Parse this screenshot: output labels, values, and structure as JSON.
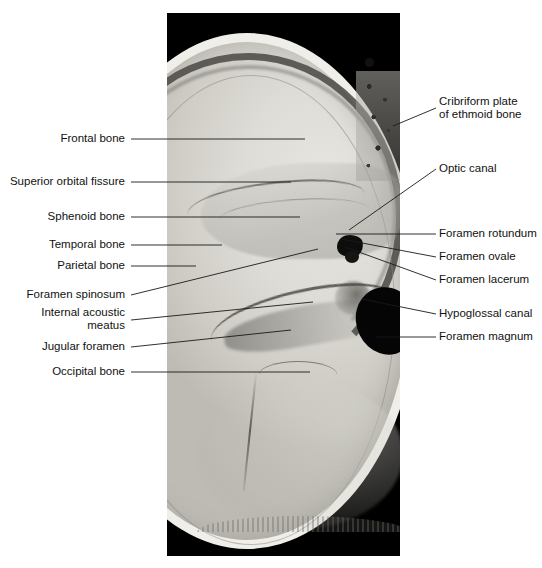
{
  "figure": {
    "background_color": "#ffffff",
    "panel_background_color": "#000000",
    "label_color": "#111111",
    "leader_color": "#1a1a1a"
  },
  "labels_left": [
    {
      "id": "frontal-bone",
      "text": "Frontal bone",
      "lines": [
        "Frontal bone"
      ]
    },
    {
      "id": "superior-orbital-fissure",
      "text": "Superior orbital fissure",
      "lines": [
        "Superior orbital fissure"
      ]
    },
    {
      "id": "sphenoid-bone",
      "text": "Sphenoid bone",
      "lines": [
        "Sphenoid bone"
      ]
    },
    {
      "id": "temporal-bone",
      "text": "Temporal bone",
      "lines": [
        "Temporal bone"
      ]
    },
    {
      "id": "parietal-bone",
      "text": "Parietal bone",
      "lines": [
        "Parietal bone"
      ]
    },
    {
      "id": "foramen-spinosum",
      "text": "Foramen spinosum",
      "lines": [
        "Foramen spinosum"
      ]
    },
    {
      "id": "internal-acoustic-meatus",
      "text": "Internal acoustic meatus",
      "lines": [
        "Internal acoustic",
        "meatus"
      ]
    },
    {
      "id": "jugular-foramen",
      "text": "Jugular foramen",
      "lines": [
        "Jugular foramen"
      ]
    },
    {
      "id": "occipital-bone",
      "text": "Occipital bone",
      "lines": [
        "Occipital bone"
      ]
    }
  ],
  "labels_right": [
    {
      "id": "cribriform-plate-of-ethmoid-bone",
      "text": "Cribriform plate of ethmoid bone",
      "lines": [
        "Cribriform plate",
        "of ethmoid bone"
      ]
    },
    {
      "id": "optic-canal",
      "text": "Optic canal",
      "lines": [
        "Optic canal"
      ]
    },
    {
      "id": "foramen-rotundum",
      "text": "Foramen rotundum",
      "lines": [
        "Foramen rotundum"
      ]
    },
    {
      "id": "foramen-ovale",
      "text": "Foramen ovale",
      "lines": [
        "Foramen ovale"
      ]
    },
    {
      "id": "foramen-lacerum",
      "text": "Foramen lacerum",
      "lines": [
        "Foramen lacerum"
      ]
    },
    {
      "id": "hypoglossal-canal",
      "text": "Hypoglossal canal",
      "lines": [
        "Hypoglossal canal"
      ]
    },
    {
      "id": "foramen-magnum",
      "text": "Foramen magnum",
      "lines": [
        "Foramen magnum"
      ]
    }
  ],
  "label_text": {
    "frontal_bone": "Frontal bone",
    "superior_orbital_fissure": "Superior orbital fissure",
    "sphenoid_bone": "Sphenoid bone",
    "temporal_bone": "Temporal bone",
    "parietal_bone": "Parietal bone",
    "foramen_spinosum": "Foramen spinosum",
    "internal_acoustic_line1": "Internal acoustic",
    "internal_acoustic_line2": "meatus",
    "jugular_foramen": "Jugular foramen",
    "occipital_bone": "Occipital bone",
    "cribriform_line1": "Cribriform plate",
    "cribriform_line2": "of ethmoid bone",
    "optic_canal": "Optic canal",
    "foramen_rotundum": "Foramen rotundum",
    "foramen_ovale": "Foramen ovale",
    "foramen_lacerum": "Foramen lacerum",
    "hypoglossal_canal": "Hypoglossal canal",
    "foramen_magnum": "Foramen magnum"
  }
}
